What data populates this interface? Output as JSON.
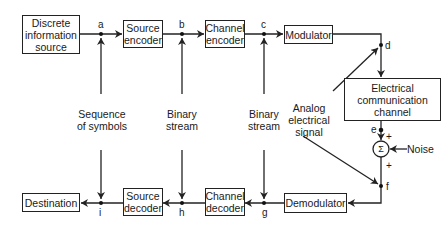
{
  "diagram": {
    "blocks": {
      "source": "Discrete\ninformation\nsource",
      "source_encoder": "Source\nencoder",
      "channel_encoder": "Channel\nencoder",
      "modulator": "Modulator",
      "channel": "Electrical\ncommunication\nchannel",
      "demodulator": "Demodulator",
      "channel_decoder": "Channel\ndecoder",
      "source_decoder": "Source\ndecoder",
      "destination": "Destination",
      "summer": "Σ"
    },
    "nodes": {
      "a": "a",
      "b": "b",
      "c": "c",
      "d": "d",
      "e": "e",
      "f": "f",
      "g": "g",
      "h": "h",
      "i": "i"
    },
    "annotations": {
      "sequence_of_symbols": "Sequence\nof symbols",
      "binary_stream_1": "Binary\nstream",
      "binary_stream_2": "Binary\nstream",
      "analog_signal": "Analog\nelectrical\nsignal",
      "noise": "Noise",
      "plus_top": "+",
      "plus_bottom": "+"
    }
  }
}
